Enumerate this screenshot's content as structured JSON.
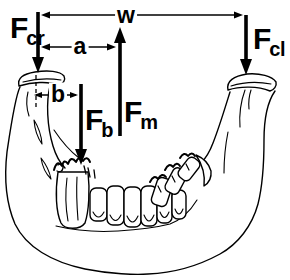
{
  "figure": {
    "kind": "free-body diagram",
    "ink_color": "#000000",
    "background_color": "#ffffff"
  },
  "vectors": {
    "fcr": {
      "symbol": "F",
      "subscript": "cr",
      "direction": "down"
    },
    "fcl": {
      "symbol": "F",
      "subscript": "cl",
      "direction": "down"
    },
    "fm": {
      "symbol": "F",
      "subscript": "m",
      "direction": "up"
    },
    "fb": {
      "symbol": "F",
      "subscript": "b",
      "direction": "down"
    }
  },
  "dimensions": {
    "w": {
      "label": "w"
    },
    "a": {
      "label": "a"
    },
    "b": {
      "label": "b"
    }
  }
}
